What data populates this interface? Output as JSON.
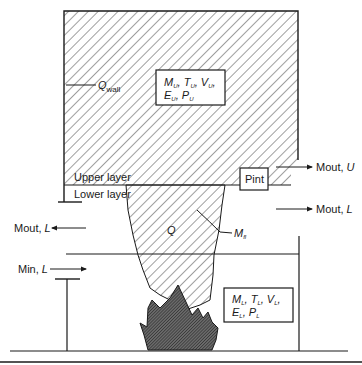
{
  "diagram": {
    "type": "two-zone fire compartment model",
    "labels": {
      "q_wall": "Q",
      "q_wall_sub": "wall",
      "upper_layer": "Upper layer",
      "lower_layer": "Lower layer",
      "pint": "Pint",
      "mout_u": "Mout, ",
      "mout_u_var": "U",
      "mout_l_right": "Mout, ",
      "mout_l_right_var": "L",
      "mout_l_left": "Mout, ",
      "mout_l_left_var": "L",
      "min_l": "Min, ",
      "min_l_var": "L",
      "q_plume": "Q",
      "m_plume": "M",
      "m_plume_sub": "fl"
    },
    "upper_box": {
      "line1": [
        "M",
        "U",
        "T",
        "U",
        "V",
        "U"
      ],
      "line2": [
        "E",
        "U",
        "P",
        "U"
      ]
    },
    "lower_box": {
      "line1": [
        "M",
        "L",
        "T",
        "L",
        "V",
        "L"
      ],
      "line2": [
        "E",
        "L",
        "P",
        "L"
      ]
    },
    "colors": {
      "line": "#1a1a1a",
      "hatch": "#2a2a2a",
      "flame_fill": "#555555",
      "background": "#ffffff"
    }
  }
}
